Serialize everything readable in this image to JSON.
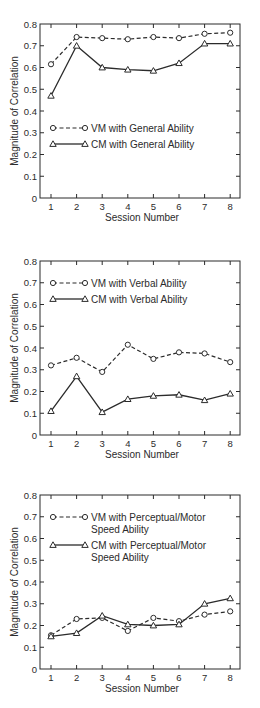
{
  "chart_data": [
    {
      "type": "line",
      "title": "",
      "xlabel": "Session Number",
      "ylabel": "Magnitude of Correlation",
      "x": [
        1,
        2,
        3,
        4,
        5,
        6,
        7,
        8
      ],
      "xticks": [
        "1",
        "2",
        "3",
        "4",
        "5",
        "6",
        "7",
        "8"
      ],
      "yticks": [
        "0",
        "0.1",
        "0.2",
        "0.3",
        "0.4",
        "0.5",
        "0.6",
        "0.7",
        "0.8"
      ],
      "ylim": [
        0,
        0.8
      ],
      "grid": false,
      "legend_position": "middle-left",
      "series": [
        {
          "name": "VM with General Ability",
          "style": "dashed",
          "marker": "circle",
          "values": [
            0.615,
            0.74,
            0.735,
            0.73,
            0.74,
            0.735,
            0.755,
            0.76
          ]
        },
        {
          "name": "CM with General Ability",
          "style": "solid",
          "marker": "triangle",
          "values": [
            0.47,
            0.7,
            0.6,
            0.59,
            0.585,
            0.62,
            0.71,
            0.71
          ]
        }
      ]
    },
    {
      "type": "line",
      "title": "",
      "xlabel": "Session Number",
      "ylabel": "Magnitude of Correlation",
      "x": [
        1,
        2,
        3,
        4,
        5,
        6,
        7,
        8
      ],
      "xticks": [
        "1",
        "2",
        "3",
        "4",
        "5",
        "6",
        "7",
        "8"
      ],
      "yticks": [
        "0",
        "0.1",
        "0.2",
        "0.3",
        "0.4",
        "0.5",
        "0.6",
        "0.7",
        "0.8"
      ],
      "ylim": [
        0,
        0.8
      ],
      "grid": false,
      "legend_position": "top-left",
      "series": [
        {
          "name": "VM with Verbal Ability",
          "style": "dashed",
          "marker": "circle",
          "values": [
            0.32,
            0.355,
            0.29,
            0.415,
            0.35,
            0.38,
            0.375,
            0.335
          ]
        },
        {
          "name": "CM with Verbal Ability",
          "style": "solid",
          "marker": "triangle",
          "values": [
            0.11,
            0.27,
            0.105,
            0.165,
            0.18,
            0.185,
            0.16,
            0.19
          ]
        }
      ]
    },
    {
      "type": "line",
      "title": "",
      "xlabel": "Session Number",
      "ylabel": "Magnitude of Correlation",
      "x": [
        1,
        2,
        3,
        4,
        5,
        6,
        7,
        8
      ],
      "xticks": [
        "1",
        "2",
        "3",
        "4",
        "5",
        "6",
        "7",
        "8"
      ],
      "yticks": [
        "0",
        "0.1",
        "0.2",
        "0.3",
        "0.4",
        "0.5",
        "0.6",
        "0.7",
        "0.8"
      ],
      "ylim": [
        0,
        0.8
      ],
      "grid": false,
      "legend_position": "top-left",
      "series": [
        {
          "name": "VM with Perceptual/Motor Speed Ability",
          "legend_lines": [
            "VM with Perceptual/Motor",
            "Speed Ability"
          ],
          "style": "dashed",
          "marker": "circle",
          "values": [
            0.155,
            0.23,
            0.235,
            0.175,
            0.235,
            0.22,
            0.25,
            0.265
          ]
        },
        {
          "name": "CM with Perceptual/Motor Speed Ability",
          "legend_lines": [
            "CM with Perceptual/Motor",
            "Speed Ability"
          ],
          "style": "solid",
          "marker": "triangle",
          "values": [
            0.15,
            0.165,
            0.245,
            0.205,
            0.2,
            0.205,
            0.3,
            0.325
          ]
        }
      ]
    }
  ]
}
